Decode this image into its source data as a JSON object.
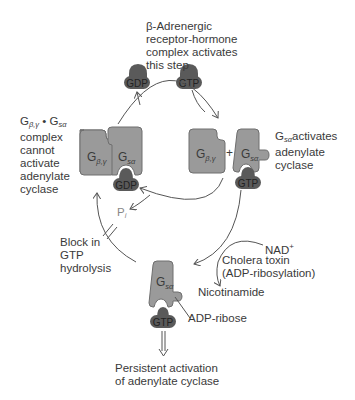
{
  "labels": {
    "receptor_note": [
      "β-Adrenergic",
      "receptor-hormone",
      "complex activates",
      "this step"
    ],
    "inactive_complex_note": {
      "line1_g": "G",
      "line1_sub1": "β,γ",
      "line1_dot": " • G",
      "line1_sub2": "sα",
      "lines": [
        "complex",
        "cannot",
        "activate",
        "adenylate",
        "cyclase"
      ]
    },
    "gsa_activates_note": {
      "g": "G",
      "sub": "sα",
      "text": "activates",
      "lines": [
        "adenylate",
        "cyclase"
      ]
    },
    "pi": {
      "p": "P",
      "sub": "i"
    },
    "block_note": [
      "Block in",
      "GTP",
      "hydrolysis"
    ],
    "nad": {
      "text": "NAD",
      "sup": "+"
    },
    "cholera_note": [
      "Cholera toxin",
      "(ADP-ribosylation)"
    ],
    "nicotinamide": "Nicotinamide",
    "adp_ribose": "ADP-ribose",
    "outcome_note": [
      "Persistent activation",
      "of adenylate cyclase"
    ],
    "plus": "+"
  },
  "nucleotides": {
    "gdp_top": "GDP",
    "gtp_top": "GTP",
    "gdp_bound": "GDP",
    "gtp_bound_right": "GTP",
    "gtp_bound_bottom": "GTP"
  },
  "subunits": {
    "gbg": {
      "g": "G",
      "sub": "β,γ"
    },
    "gsa": {
      "g": "G",
      "sub": "sα"
    }
  },
  "colors": {
    "protein": "#9a9a9a",
    "protein_stroke": "#6e6e6e",
    "nucleotide": "#5a5a5a",
    "arrow": "#555555",
    "text": "#3a3a3a"
  }
}
